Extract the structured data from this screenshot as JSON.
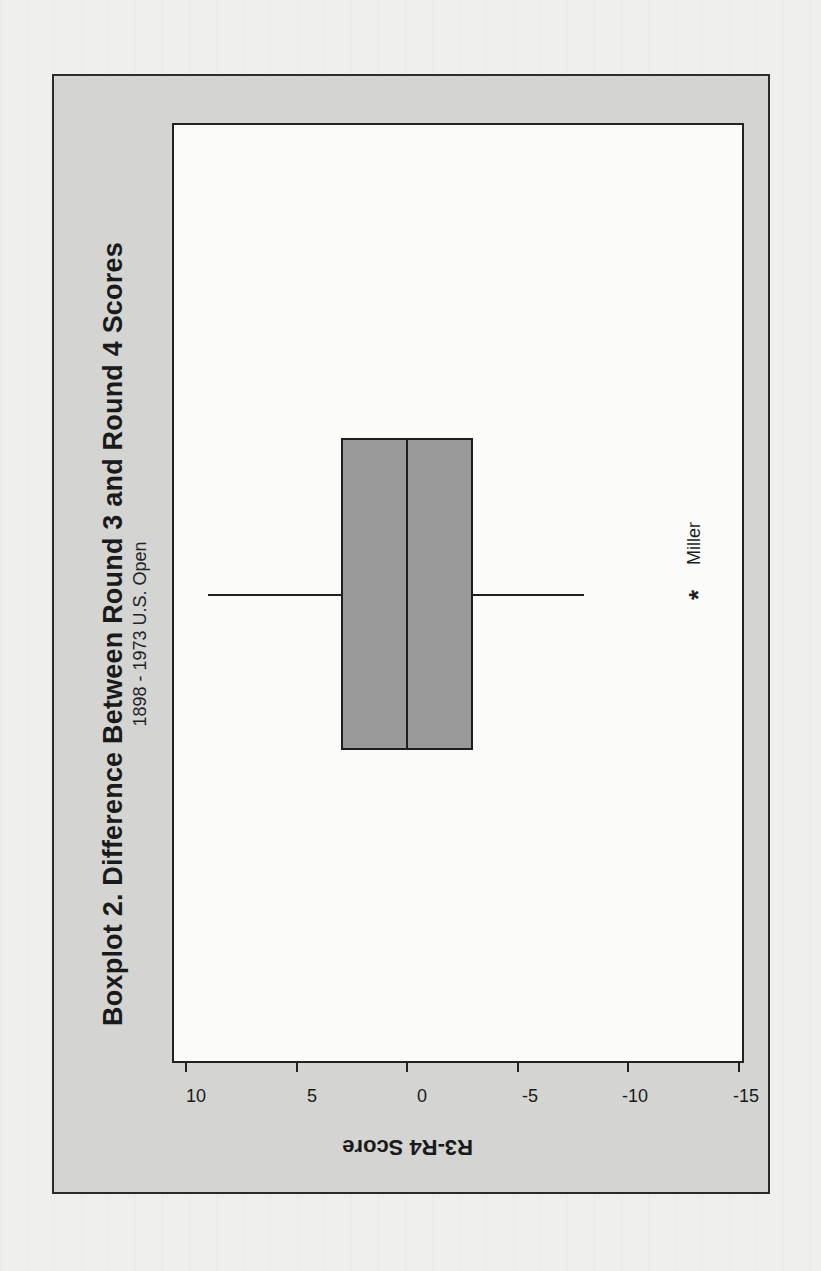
{
  "chart_data": {
    "type": "boxplot",
    "orientation_on_page": "rotated 90 degrees counter-clockwise (title reads bottom-to-top)",
    "title": "Boxplot 2. Difference Between Round 3 and Round 4 Scores",
    "subtitle": "1898 - 1973 U.S. Open",
    "ylabel": "R3-R4 Score",
    "xlabel": "",
    "ylim": [
      -15.5,
      10.5
    ],
    "yticks": [
      10,
      5,
      0,
      -5,
      -10,
      -15
    ],
    "ytick_labels": [
      "10",
      "5",
      "0",
      "-5",
      "-10",
      "-15"
    ],
    "grid": false,
    "legend": null,
    "series": [
      {
        "name": "R3-R4 Score",
        "whisker_high": 9,
        "q3": 3,
        "median": 0,
        "q1": -3,
        "whisker_low": -8,
        "outliers": [
          {
            "value": -13,
            "label": "Miller",
            "marker": "*"
          }
        ]
      }
    ]
  },
  "figure": {
    "title": "Boxplot 2. Difference Between Round 3 and Round 4 Scores",
    "subtitle": "1898 - 1973 U.S. Open",
    "axis_label": "R3-R4 Score",
    "ticks": [
      "10",
      "5",
      "0",
      "-5",
      "-10",
      "-15"
    ],
    "outlier_marker": "*",
    "outlier_label": "Miller"
  },
  "colors": {
    "frame_bg": "#d4d4d2",
    "plot_bg": "#fbfbfa",
    "box_fill": "#9a9a9a",
    "line": "#1e1e1e",
    "page_bg": "#efefed"
  }
}
